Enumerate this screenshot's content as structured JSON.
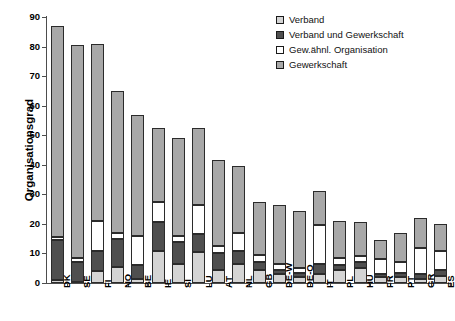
{
  "chart_data": {
    "type": "bar",
    "stacked": true,
    "title": "",
    "xlabel": "",
    "ylabel": "Organisationsgrad",
    "ylim": [
      0,
      90
    ],
    "yticks": [
      0,
      10,
      20,
      30,
      40,
      50,
      60,
      70,
      80,
      90
    ],
    "grid": false,
    "legend_position": "top-right",
    "categories": [
      "DK",
      "SE",
      "FI",
      "NO",
      "BE",
      "IE",
      "SI",
      "LU",
      "AT",
      "NL",
      "GB",
      "DE-W",
      "DE-O",
      "IT",
      "PL",
      "HU",
      "FR",
      "PT",
      "GR",
      "ES"
    ],
    "series": [
      {
        "name": "Gewerkschaft",
        "color": "#a8a8a8",
        "values": [
          71.5,
          72.0,
          60.0,
          48.0,
          41.0,
          25.0,
          33.0,
          26.0,
          29.0,
          22.5,
          18.0,
          20.0,
          19.5,
          11.5,
          12.5,
          11.5,
          6.5,
          10.0,
          10.0,
          9.0
        ]
      },
      {
        "name": "Gew.ähnl. Organisation",
        "color": "#ffffff",
        "values": [
          1.0,
          1.5,
          10.0,
          2.0,
          10.0,
          7.0,
          2.0,
          10.0,
          2.5,
          6.0,
          2.5,
          2.0,
          1.5,
          13.0,
          2.5,
          2.0,
          5.0,
          3.5,
          9.0,
          6.5
        ]
      },
      {
        "name": "Verband und Gewerkschaft",
        "color": "#4f4f4f",
        "values": [
          13.5,
          6.5,
          7.0,
          9.5,
          4.5,
          9.5,
          7.5,
          6.0,
          5.5,
          4.5,
          2.5,
          1.5,
          1.5,
          3.5,
          1.5,
          2.0,
          1.0,
          1.5,
          1.5,
          2.0
        ]
      },
      {
        "name": "Verband",
        "color": "#d4d4d4",
        "values": [
          1.0,
          0.5,
          4.0,
          5.5,
          1.5,
          11.0,
          6.5,
          10.5,
          4.5,
          6.5,
          4.5,
          3.0,
          2.0,
          3.0,
          4.5,
          5.0,
          2.0,
          2.0,
          1.5,
          2.5
        ]
      }
    ],
    "totals": [
      87.0,
      80.5,
      81.0,
      65.0,
      57.0,
      52.5,
      49.0,
      52.5,
      41.5,
      39.5,
      27.5,
      26.5,
      24.5,
      31.0,
      21.0,
      20.5,
      14.5,
      17.0,
      22.0,
      20.0
    ]
  },
  "legend": {
    "items": [
      {
        "label": "Verband",
        "swatch": "#d4d4d4"
      },
      {
        "label": "Verband und Gewerkschaft",
        "swatch": "#4f4f4f"
      },
      {
        "label": "Gew.ähnl. Organisation",
        "swatch": "#ffffff"
      },
      {
        "label": "Gewerkschaft",
        "swatch": "#a8a8a8"
      }
    ]
  },
  "axis": {
    "y_title": "Organisationsgrad",
    "y_tick_labels": [
      "0",
      "10",
      "20",
      "30",
      "40",
      "50",
      "60",
      "70",
      "80",
      "90"
    ]
  }
}
